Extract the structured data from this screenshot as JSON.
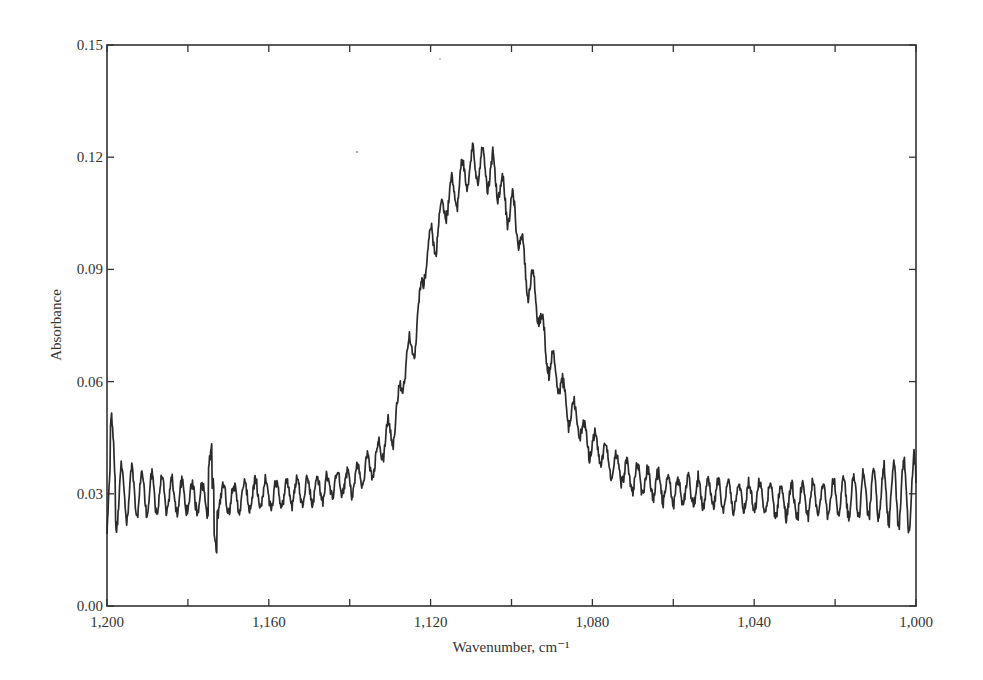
{
  "chart_data": {
    "type": "line",
    "title": "",
    "xlabel": "Wavenumber, cm⁻¹",
    "ylabel": "Absorbance",
    "xlim": [
      1200,
      1000
    ],
    "ylim": [
      0.0,
      0.15
    ],
    "x_reversed": true,
    "grid": false,
    "legend": null,
    "x_ticks": [
      1200,
      1160,
      1120,
      1080,
      1040,
      1000
    ],
    "x_tick_labels": [
      "1,200",
      "1,160",
      "1,120",
      "1,080",
      "1,040",
      "1,000"
    ],
    "x_minor_ticks": [
      1180,
      1140,
      1100,
      1060,
      1020
    ],
    "y_ticks": [
      0.0,
      0.03,
      0.06,
      0.09,
      0.12,
      0.15
    ],
    "y_tick_labels": [
      "0.00",
      "0.03",
      "0.06",
      "0.09",
      "0.12",
      "0.15"
    ],
    "series": [
      {
        "name": "Absorbance spectrum",
        "color": "#2b2b2b",
        "description": "Broad absorption band centered near 1,108 cm-1 with superimposed periodic fringe oscillation (~2.5 cm-1 period) on a ~0.03 baseline",
        "x": [
          1200,
          1190,
          1180,
          1170,
          1160,
          1150,
          1140,
          1135,
          1130,
          1125,
          1120,
          1115,
          1110,
          1108,
          1105,
          1100,
          1095,
          1090,
          1085,
          1080,
          1075,
          1070,
          1060,
          1050,
          1040,
          1030,
          1020,
          1010,
          1000
        ],
        "y": [
          0.03,
          0.03,
          0.029,
          0.029,
          0.03,
          0.031,
          0.033,
          0.037,
          0.046,
          0.068,
          0.097,
          0.11,
          0.117,
          0.118,
          0.116,
          0.106,
          0.085,
          0.064,
          0.051,
          0.043,
          0.038,
          0.034,
          0.031,
          0.03,
          0.029,
          0.028,
          0.029,
          0.03,
          0.03
        ],
        "peak": {
          "x": 1108,
          "y": 0.12
        },
        "noise_amplitude_edges": 0.008,
        "noise_amplitude_center": 0.006
      }
    ]
  }
}
